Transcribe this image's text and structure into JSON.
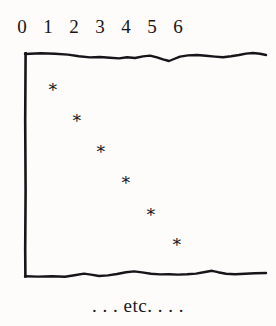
{
  "figure": {
    "background_color": "#fdfcfa",
    "ink_color": "#17151a",
    "caption": ". . . etc. . . ."
  },
  "chart_data": {
    "type": "scatter",
    "title": "",
    "subtitle": "",
    "xlabel": "",
    "ylabel": "",
    "axis_position": "top",
    "grid": false,
    "legend": null,
    "frame_style": "hand-drawn wavy top and bottom rules, solid left rule, open right edge (figure continues)",
    "annotations": [
      ". . . etc. . . ."
    ],
    "xticklabels": [
      "0",
      "1",
      "2",
      "3",
      "4",
      "5",
      "6"
    ],
    "x": [
      1,
      2,
      3,
      4,
      5,
      6
    ],
    "y": [
      1,
      2,
      3,
      4,
      5,
      6
    ],
    "xlim": [
      0,
      9.5
    ],
    "ylim": [
      0,
      9
    ],
    "marker": "asterisk",
    "marker_glyph": "∗",
    "points": [
      {
        "x": 1,
        "y": 1,
        "px": 53,
        "py": 90
      },
      {
        "x": 2,
        "y": 2,
        "px": 77,
        "py": 121
      },
      {
        "x": 3,
        "y": 3,
        "px": 101,
        "py": 152
      },
      {
        "x": 4,
        "y": 4,
        "px": 126,
        "py": 183
      },
      {
        "x": 5,
        "y": 5,
        "px": 151,
        "py": 215
      },
      {
        "x": 6,
        "y": 6,
        "px": 177,
        "py": 245
      }
    ],
    "tick_positions_px": [
      22,
      48,
      74,
      100,
      126,
      152,
      178
    ]
  }
}
